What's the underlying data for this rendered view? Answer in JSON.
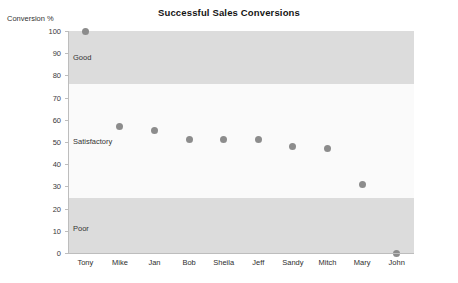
{
  "chart_data": {
    "type": "scatter",
    "title": "Successful Sales Conversions",
    "xlabel": "",
    "ylabel": "Conversion %",
    "ylim": [
      0,
      100
    ],
    "yticks": [
      0,
      10,
      20,
      30,
      40,
      50,
      60,
      70,
      80,
      90,
      100
    ],
    "grid": false,
    "legend": "none",
    "categories": [
      "Tony",
      "Mike",
      "Jan",
      "Bob",
      "Sheila",
      "Jeff",
      "Sandy",
      "Mitch",
      "Mary",
      "John"
    ],
    "values": [
      100,
      57,
      55,
      51,
      51,
      51,
      48,
      47,
      31,
      0
    ],
    "bands": [
      {
        "label": "Good",
        "from": 76,
        "to": 100,
        "color": "#dcdcdc",
        "label_at": 88
      },
      {
        "label": "Satisfactory",
        "from": 25,
        "to": 76,
        "color": "#fafafa",
        "label_at": 50
      },
      {
        "label": "Poor",
        "from": 0,
        "to": 25,
        "color": "#dcdcdc",
        "label_at": 11
      }
    ],
    "marker_color": "#8c8c8c",
    "axis_color": "#bdbdbd"
  }
}
